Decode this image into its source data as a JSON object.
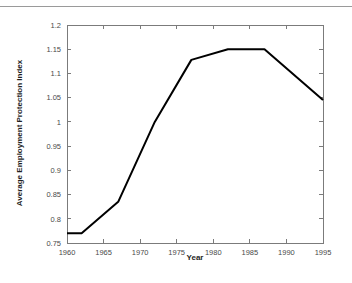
{
  "chart_data": {
    "type": "line",
    "title": "",
    "xlabel": "Year",
    "ylabel": "Average Employment Protection Index",
    "xlim": [
      1960,
      1995
    ],
    "ylim": [
      0.75,
      1.2
    ],
    "grid": false,
    "legend": null,
    "xticks": [
      1960,
      1965,
      1970,
      1975,
      1980,
      1985,
      1990,
      1995
    ],
    "xtick_labels": [
      "1960",
      "1965",
      "1970",
      "1975",
      "1980",
      "1985",
      "1990",
      "1995"
    ],
    "yticks": [
      0.75,
      0.8,
      0.85,
      0.9,
      0.95,
      1,
      1.05,
      1.1,
      1.15,
      1.2
    ],
    "ytick_labels": [
      "0.75",
      "0.8",
      "0.85",
      "0.9",
      "0.95",
      "1",
      "1.05",
      "1.1",
      "1.15",
      "1.2"
    ],
    "line_color": "#000000",
    "series": [
      {
        "name": "Average Employment Protection Index",
        "x": [
          1960,
          1962,
          1967,
          1972,
          1977,
          1982,
          1987,
          1995
        ],
        "values": [
          0.77,
          0.77,
          0.835,
          1.0,
          1.128,
          1.15,
          1.15,
          1.045
        ]
      }
    ]
  }
}
